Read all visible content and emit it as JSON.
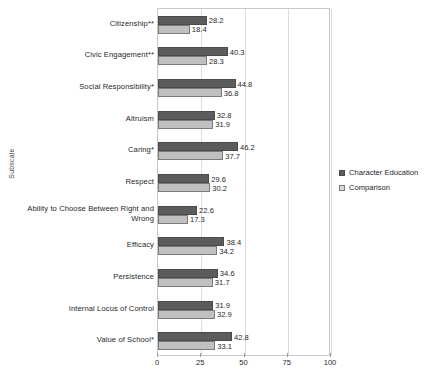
{
  "chart_data": {
    "type": "bar",
    "orientation": "horizontal",
    "title": "",
    "xlabel": "",
    "ylabel": "Subscale",
    "xlim": [
      0,
      100
    ],
    "xticks": [
      0,
      25,
      50,
      75,
      100
    ],
    "grid": true,
    "legend_position": "right",
    "categories": [
      "Citizenship**",
      "Civic Engagement**",
      "Social Responsibility*",
      "Altruism",
      "Caring*",
      "Respect",
      "Ability to Choose Between Right and Wrong",
      "Efficacy",
      "Persistence",
      "Internal Locus of Control",
      "Value of School*"
    ],
    "series": [
      {
        "name": "Character Education",
        "color": "#5c5c5c",
        "values": [
          28.2,
          40.3,
          44.8,
          32.8,
          46.2,
          29.6,
          22.6,
          38.4,
          34.6,
          31.9,
          42.8
        ]
      },
      {
        "name": "Comparison",
        "color": "#c0c0c0",
        "values": [
          18.4,
          28.3,
          36.8,
          31.9,
          37.7,
          30.2,
          17.3,
          34.2,
          31.7,
          32.9,
          33.1
        ]
      }
    ]
  }
}
